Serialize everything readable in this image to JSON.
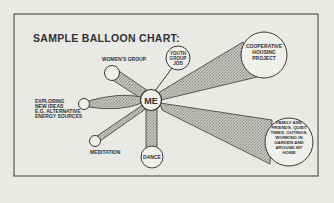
{
  "title": "SAMPLE BALLOON CHART:",
  "center": {
    "label": "ME"
  },
  "balloons": [
    {
      "id": "womens-group",
      "lines": [
        "WOMEN'S GROUP"
      ]
    },
    {
      "id": "youth-group-job",
      "lines": [
        "YOUTH",
        "GROUP",
        "JOB"
      ]
    },
    {
      "id": "cooperative-housing",
      "lines": [
        "COOPERATIVE",
        "HOUSING",
        "PROJECT"
      ]
    },
    {
      "id": "exploring",
      "lines": [
        "EXPLORING",
        "NEW IDEAS",
        "E.G. ALTERNATIVE",
        "ENERGY SOURCES"
      ]
    },
    {
      "id": "meditation",
      "lines": [
        "MEDITATION"
      ]
    },
    {
      "id": "dance",
      "lines": [
        "DANCE"
      ]
    },
    {
      "id": "family-friends",
      "lines": [
        "FAMILY AND",
        "FRIENDS, QUIET",
        "TIMES, OUTINGS,",
        "WORKING IN",
        "GARDEN AND",
        "AROUND MY",
        "HOME"
      ]
    }
  ],
  "colors": {
    "background": "#e9e9e6",
    "ink": "#333333",
    "fill": "#b5b5b0",
    "circle": "#efefec"
  }
}
